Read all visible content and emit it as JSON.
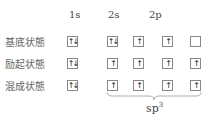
{
  "headers": {
    "s1": "1s",
    "s2": "2s",
    "p2": "2p"
  },
  "rows": [
    {
      "label": "基底状態",
      "orbitals": [
        "↑↓",
        "↑↓",
        "↑",
        "↑",
        ""
      ]
    },
    {
      "label": "励起状態",
      "orbitals": [
        "↑↓",
        "↑",
        "↑",
        "↑",
        "↑"
      ]
    },
    {
      "label": "混成状態",
      "orbitals": [
        "↑↓",
        "↑",
        "↑",
        "↑",
        "↑"
      ]
    }
  ],
  "hybrid": {
    "base": "sp",
    "sup": "3"
  }
}
